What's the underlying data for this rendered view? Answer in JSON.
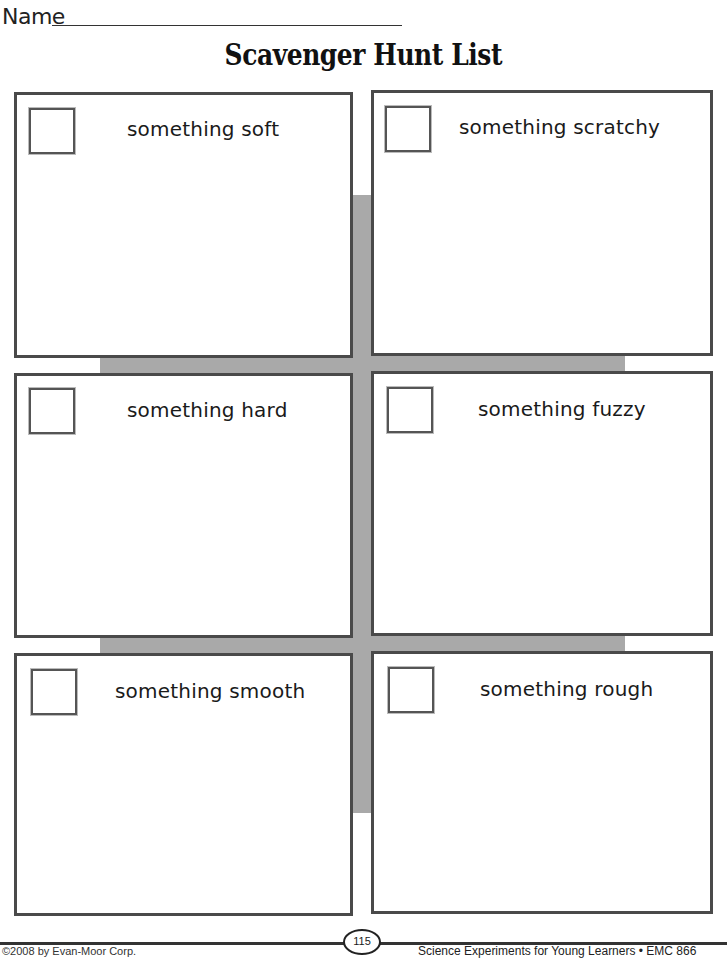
{
  "header": {
    "name_label": "Name",
    "title": "Scavenger Hunt List"
  },
  "items": [
    {
      "label": "something soft",
      "checked": false
    },
    {
      "label": "something scratchy",
      "checked": false
    },
    {
      "label": "something hard",
      "checked": false
    },
    {
      "label": "something fuzzy",
      "checked": false
    },
    {
      "label": "something smooth",
      "checked": false
    },
    {
      "label": "something rough",
      "checked": false
    }
  ],
  "footer": {
    "page_number": "115",
    "left_text": "©2008 by Evan-Moor Corp.",
    "right_text": "Science Experiments for Young Learners • EMC 866"
  },
  "colors": {
    "border": "#4a4a4a",
    "band": "#a9a9a9",
    "background": "#ffffff"
  }
}
